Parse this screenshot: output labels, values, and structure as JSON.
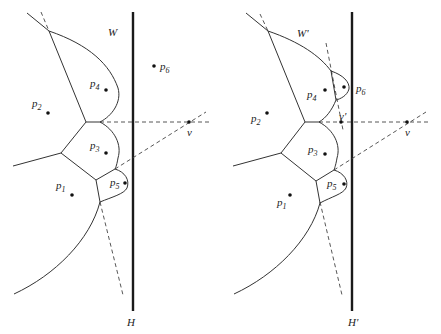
{
  "diagram": {
    "left_panel": {
      "region_label": "W",
      "line_label": "H",
      "sites": [
        {
          "name": "p",
          "sub": "1"
        },
        {
          "name": "p",
          "sub": "2"
        },
        {
          "name": "p",
          "sub": "3"
        },
        {
          "name": "p",
          "sub": "4"
        },
        {
          "name": "p",
          "sub": "5"
        },
        {
          "name": "p",
          "sub": "6"
        }
      ],
      "points": [
        {
          "label": "v"
        }
      ]
    },
    "right_panel": {
      "region_label": "W'",
      "line_label": "H'",
      "sites": [
        {
          "name": "p",
          "sub": "1"
        },
        {
          "name": "p",
          "sub": "2"
        },
        {
          "name": "p",
          "sub": "3"
        },
        {
          "name": "p",
          "sub": "4"
        },
        {
          "name": "p",
          "sub": "5"
        },
        {
          "name": "p",
          "sub": "6"
        }
      ],
      "points": [
        {
          "label": "v'"
        },
        {
          "label": "v"
        }
      ]
    }
  }
}
